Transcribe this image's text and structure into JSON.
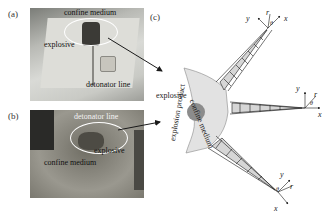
{
  "figure": {
    "panels": [
      {
        "id": "a",
        "label": "(a)",
        "annotations": [
          "confine medium",
          "explosive",
          "detonator line"
        ]
      },
      {
        "id": "b",
        "label": "(b)",
        "annotations": [
          "detonator line",
          "explosive",
          "confine medium"
        ]
      },
      {
        "id": "c",
        "label": "(c)",
        "annotations": [
          "explosive",
          "confine medium",
          "explosion product"
        ],
        "axis_labels": {
          "top_crack": [
            "y",
            "r",
            "θ",
            "x"
          ],
          "middle_crack": [
            "y",
            "r",
            "θ",
            "x"
          ],
          "bottom_crack": [
            "y",
            "r",
            "θ",
            "x"
          ]
        }
      }
    ]
  },
  "colors": {
    "medium_fill": "#e2e2e2",
    "explosive_fill": "#8c8c8c",
    "ellipse_stroke": "#ffffff",
    "arrow": "#1a1a1a"
  }
}
